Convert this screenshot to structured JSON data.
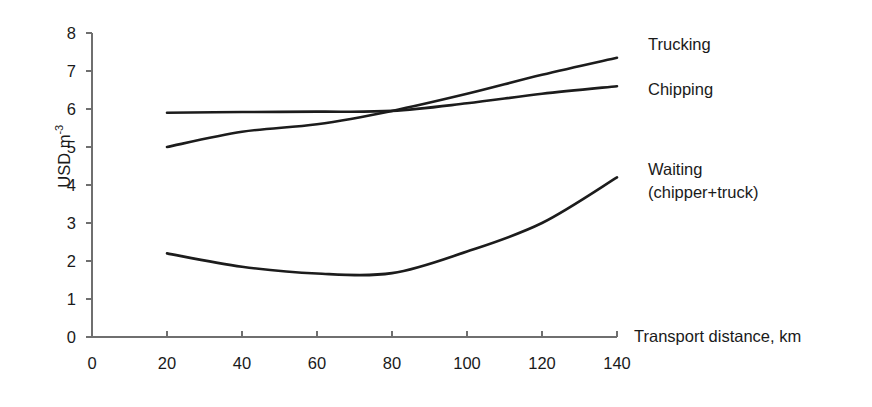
{
  "axes": {
    "y_title_main": "USD m",
    "y_title_exp": "-3",
    "x_title": "Transport distance, km",
    "y_ticks": [
      "0",
      "1",
      "2",
      "3",
      "4",
      "5",
      "6",
      "7",
      "8"
    ],
    "x_ticks": [
      "0",
      "20",
      "40",
      "60",
      "80",
      "100",
      "120",
      "140"
    ]
  },
  "labels": {
    "trucking": "Trucking",
    "chipping": "Chipping",
    "waiting_line1": "Waiting",
    "waiting_line2": "(chipper+truck)"
  },
  "colors": {
    "line": "#1c1c1c",
    "axis": "#6f6f6f",
    "text": "#1a1a1a",
    "background": "#ffffff"
  },
  "chart_data": {
    "type": "line",
    "title": "",
    "subtitle": "",
    "xlabel": "Transport distance, km",
    "ylabel": "USD m-3",
    "xlim": [
      0,
      140
    ],
    "ylim": [
      0,
      8
    ],
    "xtick_step": 20,
    "ytick_step": 1,
    "grid": false,
    "legend_position": "right-inline-annotations",
    "x": [
      20,
      40,
      60,
      80,
      100,
      120,
      140
    ],
    "series": [
      {
        "name": "Trucking",
        "values": [
          5.0,
          5.4,
          5.6,
          5.95,
          6.4,
          6.9,
          7.35
        ],
        "color": "#1c1c1c"
      },
      {
        "name": "Chipping",
        "values": [
          5.9,
          5.92,
          5.93,
          5.95,
          6.15,
          6.4,
          6.6
        ],
        "color": "#1c1c1c"
      },
      {
        "name": "Waiting (chipper+truck)",
        "values": [
          2.2,
          1.85,
          1.67,
          1.68,
          2.25,
          3.0,
          4.2
        ],
        "color": "#1c1c1c"
      }
    ],
    "annotations": [
      {
        "text": "Trucking",
        "series": "Trucking",
        "at_x": 140
      },
      {
        "text": "Chipping",
        "series": "Chipping",
        "at_x": 140
      },
      {
        "text": "Waiting (chipper+truck)",
        "series": "Waiting (chipper+truck)",
        "at_x": 140
      }
    ]
  }
}
